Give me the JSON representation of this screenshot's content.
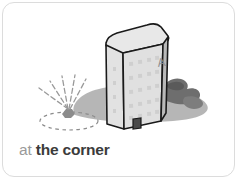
{
  "card": {
    "background_color": "#ffffff",
    "border_color": "#dcdcdc",
    "corner_radius": "12px"
  },
  "caption": {
    "prefix": "at",
    "main": "the corner",
    "full_text": "at the corner",
    "prefix_color": "#9a9a9a",
    "main_color": "#3b3b3b"
  },
  "illustration": {
    "name": "building-corner-illustration",
    "description": "Grayscale line drawing of a tall rectangular office tower standing on a gray ground shadow, with dark rocks at the right and a dashed ellipse location marker with radiating burst lines at the front-left base corner",
    "palette": {
      "outline": "#1a1a1a",
      "roof_face": "#e8e8e8",
      "front_face": "#e0e0e0",
      "side_face": "#b9b9b9",
      "ground_shadow": "#a9a9a9",
      "rocks": "#6e6e6e",
      "marker": "#8c8c8c",
      "window": "#cfcfcf",
      "door": "#4a4a4a",
      "label_letter": "#8e8e8e"
    },
    "building": {
      "label": "A",
      "window_columns": 4,
      "window_rows": 5,
      "has_door": true
    },
    "marker": {
      "name": "corner-location-marker",
      "burst_rays": 5,
      "has_dashed_ellipse": true
    }
  }
}
